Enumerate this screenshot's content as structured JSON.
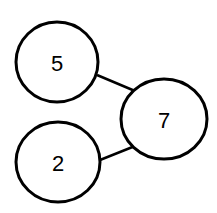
{
  "diagram": {
    "type": "number-bond",
    "whole": {
      "value": "7"
    },
    "parts": [
      {
        "value": "5"
      },
      {
        "value": "2"
      }
    ],
    "colors": {
      "stroke": "#000000",
      "fill": "#ffffff",
      "background": "#ffffff"
    }
  }
}
